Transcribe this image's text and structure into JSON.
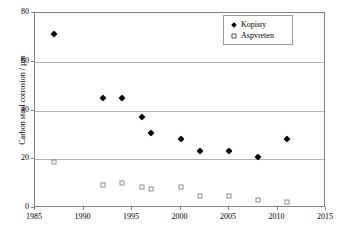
{
  "chart_data": {
    "type": "scatter",
    "title": "",
    "xlabel": "",
    "ylabel": "Carbon steel corrosion / µm",
    "xlim": [
      1985,
      2015
    ],
    "ylim": [
      0,
      80
    ],
    "xticks": [
      1985,
      1990,
      1995,
      2000,
      2005,
      2010,
      2015
    ],
    "yticks": [
      0,
      20,
      40,
      60,
      80
    ],
    "grid": "horizontal",
    "legend_position": "top-right",
    "series": [
      {
        "name": "Kopisty",
        "marker": "filled-diamond",
        "color": "#000000",
        "x": [
          1987,
          1992,
          1994,
          1996,
          1997,
          2000,
          2002,
          2005,
          2008,
          2011
        ],
        "values": [
          71.5,
          45.0,
          45.3,
          37.5,
          30.8,
          28.5,
          23.5,
          23.3,
          20.8,
          28.3
        ]
      },
      {
        "name": "Aspvreten",
        "marker": "open-square",
        "color": "#8c8c8c",
        "x": [
          1987,
          1992,
          1994,
          1996,
          1997,
          2000,
          2002,
          2005,
          2008,
          2011
        ],
        "values": [
          19.0,
          9.3,
          10.2,
          8.8,
          7.8,
          8.8,
          5.0,
          5.0,
          3.3,
          2.3
        ]
      }
    ]
  },
  "legend": {
    "entries": [
      {
        "label": "Kopisty",
        "marker": "filled-diamond"
      },
      {
        "label": "Aspvreten",
        "marker": "open-square"
      }
    ]
  }
}
